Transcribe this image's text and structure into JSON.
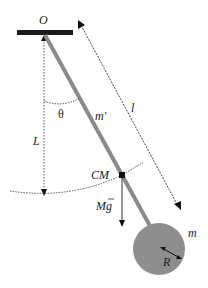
{
  "diagram": {
    "labels": {
      "pivot": "O",
      "angle": "θ",
      "rod_mass": "m′",
      "rod_length": "l",
      "cm_distance": "L",
      "center_of_mass": "CM",
      "gravity_mass": "M",
      "gravity_g": "g",
      "disk_mass": "m",
      "disk_radius": "R"
    },
    "colors": {
      "support": "#1a1a1a",
      "rod": "#8a8a8a",
      "disk": "#8e8e8e",
      "lines": "#333333",
      "dotted": "#555555",
      "cm_dot": "#111111"
    }
  }
}
